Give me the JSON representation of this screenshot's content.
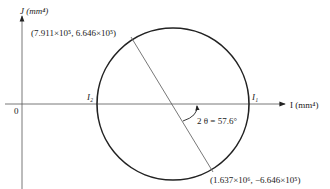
{
  "diagram": {
    "type": "mohr-circle",
    "y_axis_label": "J (mm⁴)",
    "x_axis_label": "I (mm⁴)",
    "origin_label": "0",
    "point_top": "(7.911×10⁵, 6.646×10⁵)",
    "point_bottom": "(1.637×10⁶, −6.646×10⁵)",
    "i1_label": "I₁",
    "i2_label": "I₂",
    "angle_label": "2 θ = 57.6°",
    "colors": {
      "stroke": "#222222",
      "thin_line": "#555555"
    }
  }
}
